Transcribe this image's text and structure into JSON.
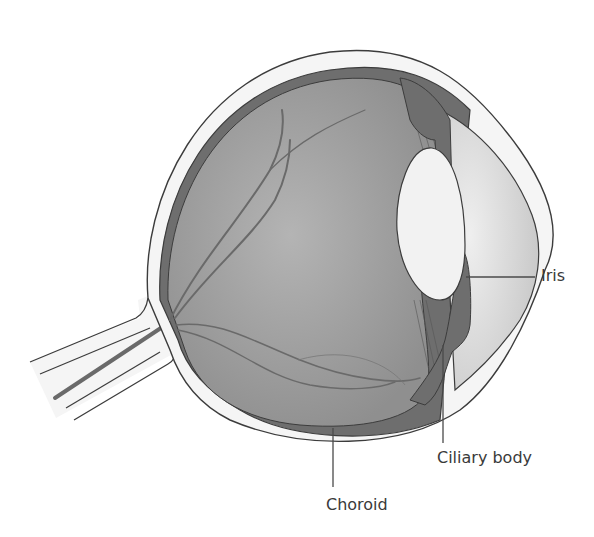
{
  "diagram": {
    "labels": [
      {
        "id": "iris",
        "text": "Iris"
      },
      {
        "id": "ciliary-body",
        "text": "Ciliary body"
      },
      {
        "id": "choroid",
        "text": "Choroid"
      }
    ],
    "colors": {
      "background": "#ffffff",
      "sclera": "#f4f4f4",
      "outline": "#3c3c3c",
      "vitreous": "#a9a9a9",
      "choroid": "#6e6e6e",
      "lens": "#f2f2f2",
      "cornea_chamber": "#d2d2d2",
      "vessels": "#6a6a6a",
      "label_text": "#3a3a3a"
    }
  }
}
